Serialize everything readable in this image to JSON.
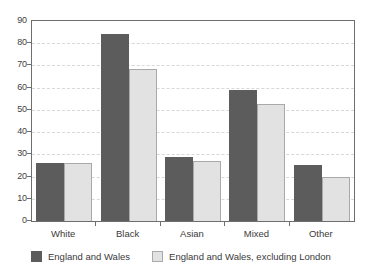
{
  "chart_data": {
    "type": "bar",
    "title": "",
    "subtitle": "",
    "xlabel": "",
    "ylabel": "",
    "categories": [
      "White",
      "Black",
      "Asian",
      "Mixed",
      "Other"
    ],
    "series": [
      {
        "name": "England and Wales",
        "color": "#5c5c5c",
        "values": [
          26,
          84,
          29,
          59,
          25
        ]
      },
      {
        "name": "England and Wales, excluding London",
        "color": "#e2e2e2",
        "values": [
          26,
          68.5,
          27,
          52.5,
          20
        ]
      }
    ],
    "ylim": [
      0,
      90
    ],
    "y_ticks": [
      0,
      10,
      20,
      30,
      40,
      50,
      60,
      70,
      80,
      90
    ],
    "y_tick_labels": [
      "0",
      "10",
      "20",
      "30",
      "40",
      "50",
      "60",
      "70",
      "80",
      "90"
    ],
    "grid": true,
    "grid_axis": "y",
    "legend_position": "bottom-left"
  },
  "legend": {
    "entries": [
      {
        "label": "England and Wales",
        "swatch": "dark-swatch"
      },
      {
        "label": "England and Wales, excluding London",
        "swatch": "light-swatch"
      }
    ]
  }
}
